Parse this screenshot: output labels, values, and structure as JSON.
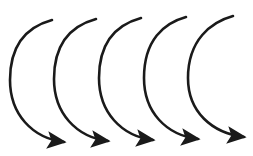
{
  "diagram": {
    "width": 253,
    "height": 156,
    "background": "#ffffff",
    "stroke_color": "#1a1a1a",
    "stroke_width": 2.6,
    "arrows": [
      {
        "start": [
          52,
          20
        ],
        "left": [
          10,
          80
        ],
        "end": [
          70,
          142
        ]
      },
      {
        "start": [
          96,
          19
        ],
        "left": [
          54,
          79
        ],
        "end": [
          114,
          141
        ]
      },
      {
        "start": [
          141,
          18
        ],
        "left": [
          99,
          78
        ],
        "end": [
          159,
          140
        ]
      },
      {
        "start": [
          186,
          17
        ],
        "left": [
          144,
          78
        ],
        "end": [
          204,
          139
        ]
      },
      {
        "start": [
          233,
          16
        ],
        "left": [
          188,
          78
        ],
        "end": [
          250,
          137
        ]
      }
    ]
  }
}
